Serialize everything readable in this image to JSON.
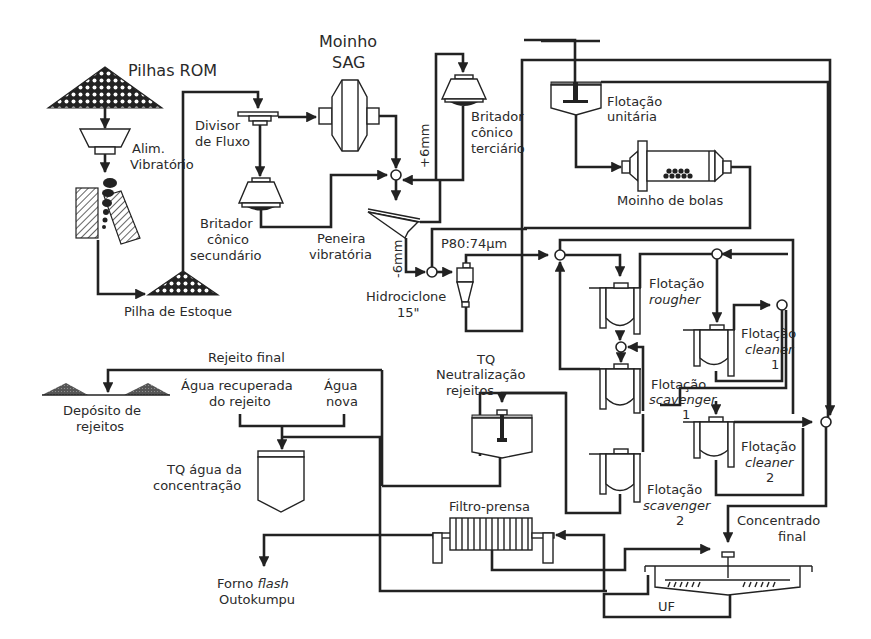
{
  "diagram": {
    "type": "process-flowsheet",
    "labels": {
      "pilhas_rom": "Pilhas ROM",
      "alim_1": "Alim.",
      "alim_2": "Vibratório",
      "divisor_1": "Divisor",
      "divisor_2": "de Fluxo",
      "moinho_sag_1": "Moinho",
      "moinho_sag_2": "SAG",
      "britador_sec_1": "Britador",
      "britador_sec_2": "cônico",
      "britador_sec_3": "secundário",
      "pilha_estoque": "Pilha de Estoque",
      "britador_ter_1": "Britador",
      "britador_ter_2": "cônico",
      "britador_ter_3": "terciário",
      "plus_6mm": "+6mm",
      "minus_6mm": "-6mm",
      "peneira_1": "Peneira",
      "peneira_2": "vibratória",
      "p80": "P80:74µm",
      "hidrociclone_1": "Hidrociclone",
      "hidrociclone_2": "15\"",
      "flot_unit_1": "Flotação",
      "flot_unit_2": "unitária",
      "moinho_bolas": "Moinho de bolas",
      "flot_rougher_1": "Flotação",
      "flot_rougher_2": "rougher",
      "flot_cleaner1_1": "Flotação",
      "flot_cleaner1_2": "cleaner",
      "flot_cleaner1_3": "1",
      "flot_scav1_1": "Flotação",
      "flot_scav1_2": "scavenger",
      "flot_scav1_3": "1",
      "flot_cleaner2_1": "Flotação",
      "flot_cleaner2_2": "cleaner",
      "flot_cleaner2_3": "2",
      "flot_scav2_1": "Flotação",
      "flot_scav2_2": "scavenger",
      "flot_scav2_3": "2",
      "rejeito_final": "Rejeito final",
      "deposito_1": "Depósito de",
      "deposito_2": "rejeitos",
      "agua_rec_1": "Água recuperada",
      "agua_rec_2": "do rejeito",
      "agua_nova_1": "Água",
      "agua_nova_2": "nova",
      "tq_neutr_1": "TQ",
      "tq_neutr_2": "Neutralização",
      "tq_neutr_3": "rejeitos",
      "tq_agua_1": "TQ água da",
      "tq_agua_2": "concentração",
      "filtro_prensa": "Filtro-prensa",
      "concentrado_1": "Concentrado",
      "concentrado_2": "final",
      "forno_1": "Forno ",
      "forno_flash": "flash",
      "forno_2": "Outokumpu",
      "uf": "UF"
    }
  }
}
